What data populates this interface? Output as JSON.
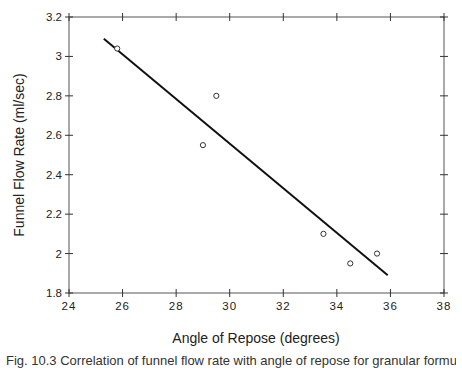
{
  "chart_data": {
    "type": "scatter",
    "title": "",
    "xlabel": "Angle of Repose (degrees)",
    "ylabel": "Funnel Flow Rate (ml/sec)",
    "xlim": [
      24,
      38
    ],
    "ylim": [
      1.8,
      3.2
    ],
    "xticks": [
      24,
      26,
      28,
      30,
      32,
      34,
      36,
      38
    ],
    "yticks": [
      1.8,
      2,
      2.2,
      2.4,
      2.6,
      2.8,
      3,
      3.2
    ],
    "xtick_labels": [
      "24",
      "26",
      "28",
      "30",
      "32",
      "34",
      "36",
      "38"
    ],
    "ytick_labels": [
      "1.8",
      "2",
      "2.2",
      "2.4",
      "2.6",
      "2.8",
      "3",
      "3.2"
    ],
    "grid": false,
    "legend": null,
    "series": [
      {
        "name": "Observed",
        "kind": "scatter",
        "marker": "open-circle",
        "points": [
          {
            "x": 25.8,
            "y": 3.04
          },
          {
            "x": 29.0,
            "y": 2.55
          },
          {
            "x": 29.5,
            "y": 2.8
          },
          {
            "x": 33.5,
            "y": 2.1
          },
          {
            "x": 34.5,
            "y": 1.95
          },
          {
            "x": 35.5,
            "y": 2.0
          }
        ]
      },
      {
        "name": "Regression line",
        "kind": "line",
        "points": [
          {
            "x": 25.3,
            "y": 3.09
          },
          {
            "x": 35.9,
            "y": 1.89
          }
        ]
      }
    ]
  },
  "caption": {
    "text": "Fig. 10.3  Correlation of funnel flow rate with angle of repose for granular formulations."
  }
}
